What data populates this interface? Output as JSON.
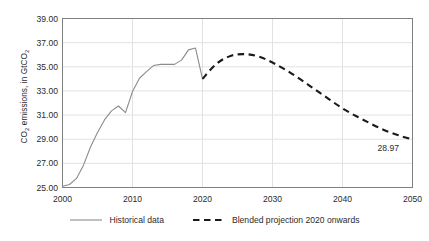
{
  "chart_data": {
    "type": "line",
    "title": "",
    "xlabel": "",
    "ylabel": "CO2 emissions, in GtCO2",
    "ylabel_parts": {
      "prefix": "CO",
      "sub1": "2",
      "mid": " emissions, in GtCO",
      "sub2": "2"
    },
    "xlim": [
      2000,
      2050
    ],
    "ylim": [
      25.0,
      39.0
    ],
    "y_ticks": [
      "25.00",
      "27.00",
      "29.00",
      "31.00",
      "33.00",
      "35.00",
      "37.00",
      "39.00"
    ],
    "y_tick_values": [
      25.0,
      27.0,
      29.0,
      31.0,
      33.0,
      35.0,
      37.0,
      39.0
    ],
    "x_ticks": [
      "2000",
      "2010",
      "2020",
      "2030",
      "2040",
      "2050"
    ],
    "x_tick_values": [
      2000,
      2010,
      2020,
      2030,
      2040,
      2050
    ],
    "grid": "both-light",
    "legend_position": "bottom-center",
    "series": [
      {
        "name": "Historical data",
        "style": "solid",
        "color": "#8c8c8c",
        "x": [
          2000,
          2001,
          2002,
          2003,
          2004,
          2005,
          2006,
          2007,
          2008,
          2009,
          2010,
          2011,
          2012,
          2013,
          2014,
          2015,
          2016,
          2017,
          2018,
          2019,
          2020
        ],
        "values": [
          25.1,
          25.25,
          25.75,
          26.85,
          28.35,
          29.55,
          30.6,
          31.35,
          31.75,
          31.2,
          32.95,
          34.05,
          34.6,
          35.1,
          35.2,
          35.2,
          35.2,
          35.55,
          36.4,
          36.55,
          34.0
        ]
      },
      {
        "name": "Blended projection 2020 onwards",
        "style": "dashed",
        "color": "#1a1a1a",
        "x": [
          2020,
          2022,
          2024,
          2026,
          2028,
          2030,
          2032,
          2034,
          2036,
          2038,
          2040,
          2042,
          2044,
          2046,
          2048,
          2050
        ],
        "values": [
          34.0,
          35.25,
          35.9,
          36.05,
          35.85,
          35.35,
          34.7,
          33.95,
          33.15,
          32.35,
          31.55,
          30.9,
          30.3,
          29.75,
          29.32,
          28.97
        ]
      }
    ],
    "annotations": [
      {
        "name": "endpoint-value-label",
        "text": "28.97",
        "x": 2050,
        "y": 28.97
      }
    ]
  },
  "legend": {
    "items": [
      {
        "label": "Historical data",
        "style": "solid",
        "color": "#8c8c8c"
      },
      {
        "label": "Blended projection 2020 onwards",
        "style": "dashed",
        "color": "#1a1a1a"
      }
    ]
  }
}
